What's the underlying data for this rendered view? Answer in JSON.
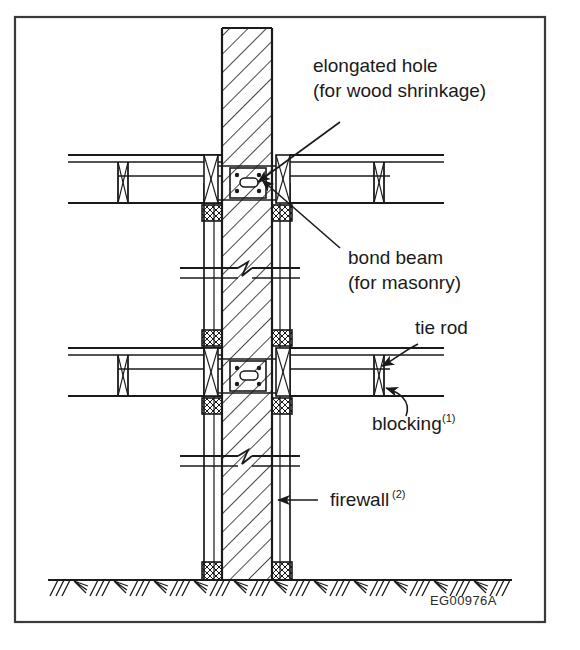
{
  "figure": {
    "id_code": "EG00976A",
    "border_color": "#3a3a3a",
    "line_color": "#1a1a1a",
    "background": "#ffffff"
  },
  "labels": [
    {
      "name": "elongated-hole",
      "line1": "elongated hole",
      "line2": "(for wood shrinkage)",
      "superscript": "",
      "x": 313,
      "y": 72
    },
    {
      "name": "bond-beam",
      "line1": "bond beam",
      "line2": "(for masonry)",
      "superscript": "",
      "x": 348,
      "y": 264
    },
    {
      "name": "tie-rod",
      "line1": "tie rod",
      "line2": "",
      "superscript": "",
      "x": 415,
      "y": 334
    },
    {
      "name": "blocking",
      "line1": "blocking",
      "line2": "",
      "superscript": "(1)",
      "x": 372,
      "y": 430
    },
    {
      "name": "firewall",
      "line1": "firewall",
      "line2": "",
      "superscript": "(2)",
      "x": 330,
      "y": 506
    }
  ],
  "diagram": {
    "type": "architectural-section-detail",
    "title_implicit": "Firewall at floor framing section detail",
    "wall": {
      "name": "firewall",
      "hatch": "diagonal-masonry",
      "left_x": 222,
      "right_x": 272,
      "top_y": 28,
      "bottom_y": 580
    },
    "floors": [
      {
        "name": "upper-floor",
        "y": 155,
        "depth": 48
      },
      {
        "name": "lower-floor",
        "y": 348,
        "depth": 48
      }
    ],
    "break_symbols": [
      {
        "name": "wall-break-upper",
        "y": 268
      },
      {
        "name": "wall-break-lower",
        "y": 456
      }
    ],
    "ground": {
      "name": "grade-line",
      "y": 580,
      "hatch": "earth"
    }
  }
}
